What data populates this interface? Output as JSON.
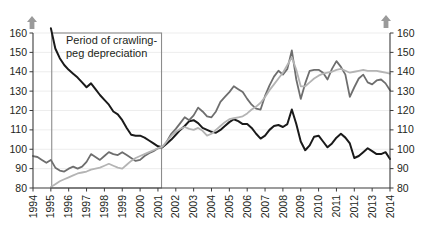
{
  "chart_data": {
    "type": "line",
    "title": "",
    "subtitle": "",
    "xlabel": "",
    "ylabel": "",
    "xlim": [
      1994,
      2014
    ],
    "ylim": [
      80,
      160
    ],
    "yticks": [
      80,
      90,
      100,
      110,
      120,
      130,
      140,
      150,
      160
    ],
    "y2ticks": [
      80,
      90,
      100,
      110,
      120,
      130,
      140,
      150,
      160
    ],
    "xticks": [
      1994,
      1995,
      1996,
      1997,
      1998,
      1999,
      2000,
      2001,
      2002,
      2003,
      2004,
      2005,
      2006,
      2007,
      2008,
      2009,
      2010,
      2011,
      2012,
      2013,
      2014
    ],
    "xtick_labels": [
      "1994",
      "1995",
      "1996",
      "1997",
      "1998",
      "1999",
      "2000",
      "2001",
      "2002",
      "2003",
      "2004",
      "2005",
      "2006",
      "2007",
      "2008",
      "2009",
      "2010",
      "2011",
      "2012",
      "2013",
      "2014"
    ],
    "xtick_rotation": 90,
    "grid": true,
    "grid_axis": "y",
    "legend": "none",
    "dual_axis": true,
    "annotations": [
      {
        "name": "crawling-peg-box",
        "text": "Period of crawling-peg depreciation",
        "text_line1": "Period of crawling-",
        "text_line2": "peg depreciation",
        "x_start": 1995.05,
        "x_end": 2001.2,
        "y_start": 80,
        "y_end": 160,
        "box": true
      },
      {
        "name": "appreciation-left",
        "text": "Appreciation",
        "icon": "arrow-up-icon",
        "position": "top-left"
      },
      {
        "name": "appreciation-right",
        "text": "Appreciation",
        "icon": "arrow-up-icon",
        "position": "top-right"
      }
    ],
    "colors": {
      "series_black": "#1a1a1a",
      "series_dark_gray": "#6e6e6e",
      "series_light_gray": "#b4b4b4",
      "axis": "#3b3b3b",
      "grid": "#e9e9e9",
      "annotation_box": "#8c8c8c",
      "arrow_icon": "#9a9a9a"
    },
    "x": [
      1994.0,
      1994.25,
      1994.5,
      1994.75,
      1995.0,
      1995.25,
      1995.5,
      1995.75,
      1996.0,
      1996.25,
      1996.5,
      1996.75,
      1997.0,
      1997.25,
      1997.5,
      1997.75,
      1998.0,
      1998.25,
      1998.5,
      1998.75,
      1999.0,
      1999.25,
      1999.5,
      1999.75,
      2000.0,
      2000.25,
      2000.5,
      2000.75,
      2001.0,
      2001.25,
      2001.5,
      2001.75,
      2002.0,
      2002.25,
      2002.5,
      2002.75,
      2003.0,
      2003.25,
      2003.5,
      2003.75,
      2004.0,
      2004.25,
      2004.5,
      2004.75,
      2005.0,
      2005.25,
      2005.5,
      2005.75,
      2006.0,
      2006.25,
      2006.5,
      2006.75,
      2007.0,
      2007.25,
      2007.5,
      2007.75,
      2008.0,
      2008.25,
      2008.5,
      2008.75,
      2009.0,
      2009.25,
      2009.5,
      2009.75,
      2010.0,
      2010.25,
      2010.5,
      2010.75,
      2011.0,
      2011.25,
      2011.5,
      2011.75,
      2012.0,
      2012.25,
      2012.5,
      2012.75,
      2013.0,
      2013.25,
      2013.5,
      2013.75,
      2014.0
    ],
    "series": [
      {
        "name": "series-black",
        "color": "#1a1a1a",
        "width": 2.0,
        "values": [
          null,
          null,
          null,
          null,
          162.5,
          152.0,
          147.0,
          143.5,
          141.0,
          139.0,
          137.0,
          134.5,
          132.0,
          134.0,
          131.0,
          128.0,
          125.5,
          123.0,
          119.5,
          118.0,
          115.0,
          111.0,
          107.5,
          107.0,
          107.0,
          106.0,
          104.5,
          103.0,
          101.5,
          101.0,
          103.0,
          105.0,
          107.5,
          110.0,
          112.0,
          114.5,
          115.0,
          113.5,
          111.0,
          110.0,
          109.0,
          108.5,
          110.0,
          112.0,
          114.0,
          115.5,
          114.5,
          113.0,
          113.0,
          111.0,
          108.0,
          105.5,
          107.0,
          110.0,
          112.0,
          112.5,
          111.5,
          113.0,
          120.5,
          113.0,
          104.0,
          99.5,
          102.0,
          106.5,
          107.0,
          104.0,
          101.0,
          103.0,
          106.0,
          108.0,
          106.0,
          103.0,
          95.5,
          96.5,
          98.5,
          100.5,
          99.0,
          97.5,
          97.5,
          98.5,
          95.0
        ]
      },
      {
        "name": "series-dark-gray",
        "color": "#6e6e6e",
        "width": 1.8,
        "values": [
          96.5,
          96.0,
          94.5,
          93.0,
          94.5,
          90.5,
          89.0,
          88.5,
          90.0,
          91.0,
          90.0,
          91.0,
          93.5,
          97.5,
          96.0,
          94.5,
          96.5,
          98.5,
          97.5,
          97.0,
          98.5,
          97.0,
          95.5,
          94.0,
          94.5,
          96.5,
          98.0,
          99.0,
          100.5,
          101.0,
          104.0,
          108.0,
          110.5,
          113.5,
          116.5,
          115.0,
          117.5,
          121.5,
          119.5,
          117.0,
          116.5,
          119.5,
          124.5,
          127.0,
          129.5,
          132.5,
          131.0,
          129.5,
          126.0,
          123.0,
          121.0,
          120.5,
          127.5,
          133.0,
          137.5,
          140.5,
          138.5,
          141.5,
          151.0,
          136.0,
          126.0,
          134.0,
          140.5,
          141.0,
          141.0,
          139.5,
          136.0,
          141.5,
          145.5,
          142.5,
          138.5,
          127.0,
          132.0,
          136.5,
          138.5,
          134.5,
          133.5,
          135.5,
          136.0,
          134.0,
          130.5
        ]
      },
      {
        "name": "series-light-gray",
        "color": "#b4b4b4",
        "width": 1.8,
        "values": [
          null,
          null,
          null,
          null,
          80.5,
          82.0,
          83.5,
          84.5,
          85.5,
          86.5,
          87.5,
          88.0,
          88.5,
          89.5,
          90.0,
          90.5,
          91.5,
          92.5,
          91.5,
          90.5,
          90.0,
          92.0,
          94.0,
          95.5,
          96.5,
          97.5,
          98.5,
          99.5,
          100.5,
          101.5,
          104.0,
          107.0,
          109.0,
          110.5,
          111.5,
          110.5,
          110.0,
          111.0,
          109.5,
          107.0,
          108.0,
          110.0,
          112.0,
          114.0,
          115.5,
          116.0,
          116.5,
          117.0,
          118.5,
          120.5,
          122.0,
          124.0,
          127.0,
          130.5,
          133.5,
          136.5,
          139.5,
          143.5,
          147.5,
          141.0,
          132.5,
          132.5,
          134.5,
          136.5,
          138.0,
          139.0,
          139.5,
          140.0,
          141.0,
          141.5,
          140.5,
          139.5,
          140.0,
          140.5,
          141.0,
          140.5,
          140.5,
          140.5,
          140.0,
          139.5,
          139.0
        ]
      }
    ]
  }
}
